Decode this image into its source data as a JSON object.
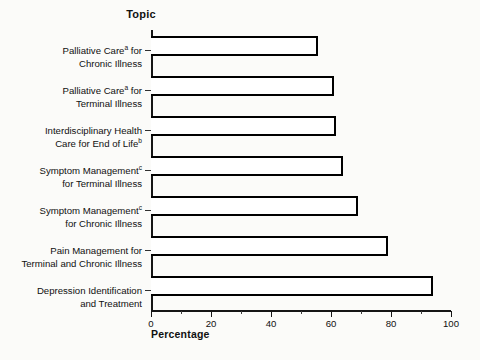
{
  "chart_data": {
    "type": "bar",
    "orientation": "horizontal",
    "title": "",
    "xlabel": "Percentage",
    "ylabel": "Topic",
    "xlim": [
      0,
      100
    ],
    "grid": false,
    "legend": null,
    "categories": [
      "Palliative Careᵃ for Chronic Illness",
      "Palliative Careᵃ for Terminal Illness",
      "Interdisciplinary Health Care for End of Lifeᵇ",
      "Symptom Managementᶜ for Terminal Illness",
      "Symptom Managementᶜ for Chronic Illness",
      "Pain Management for Terminal and Chronic Illness",
      "Depression Identification and Treatment"
    ],
    "values": [
      55.5,
      61,
      61.5,
      64,
      69,
      79,
      94
    ],
    "xticks": [
      0,
      20,
      40,
      60,
      80,
      100
    ],
    "xtick_labels": [
      "0",
      "20",
      "40",
      "60",
      "80",
      "100"
    ],
    "xminor_ticks": [
      10,
      30,
      50,
      70,
      90
    ],
    "bar_fill_color": "#ffffff",
    "bar_edge_color": "#000000",
    "background_color": "#fbfbf9"
  },
  "axes": {
    "category_axis_title": "Topic",
    "value_axis_title": "Percentage"
  },
  "category_labels": [
    {
      "line1": "Palliative Care",
      "sup1": "a",
      "line1_tail": " for",
      "line2": "Chronic Illness",
      "sup2": ""
    },
    {
      "line1": "Palliative Care",
      "sup1": "a",
      "line1_tail": " for",
      "line2": "Terminal Illness",
      "sup2": ""
    },
    {
      "line1": "Interdisciplinary Health",
      "sup1": "",
      "line1_tail": "",
      "line2": "Care for End of Life",
      "sup2": "b"
    },
    {
      "line1": "Symptom Management",
      "sup1": "c",
      "line1_tail": "",
      "line2": "for Terminal Illness",
      "sup2": ""
    },
    {
      "line1": "Symptom Management",
      "sup1": "c",
      "line1_tail": "",
      "line2": "for Chronic Illness",
      "sup2": ""
    },
    {
      "line1": "Pain Management for",
      "sup1": "",
      "line1_tail": "",
      "line2": "Terminal and Chronic Illness",
      "sup2": ""
    },
    {
      "line1": "Depression Identification",
      "sup1": "",
      "line1_tail": "",
      "line2": "and Treatment",
      "sup2": ""
    }
  ]
}
